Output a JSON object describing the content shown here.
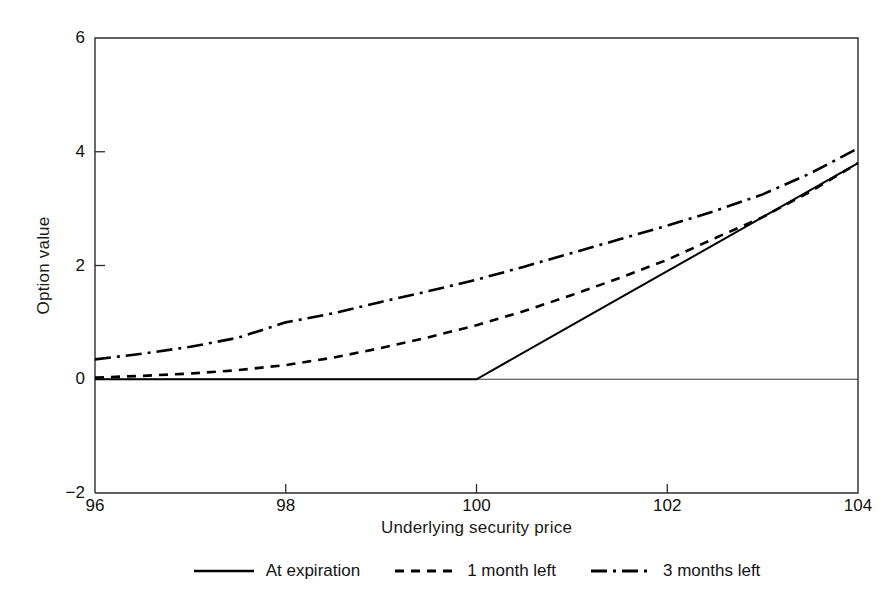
{
  "chart_data": {
    "type": "line",
    "title": "",
    "xlabel": "Underlying security price",
    "ylabel": "Option value",
    "xlim": [
      96,
      104
    ],
    "ylim": [
      -2,
      6
    ],
    "xticks": [
      96,
      98,
      100,
      102,
      104
    ],
    "yticks": [
      -2,
      0,
      2,
      4,
      6
    ],
    "xtick_labels": [
      "96",
      "98",
      "100",
      "102",
      "104"
    ],
    "ytick_labels": [
      "−2",
      "0",
      "2",
      "4",
      "6"
    ],
    "grid": false,
    "legend_position": "below-axis",
    "strike": 100,
    "zero_line": 0,
    "series": [
      {
        "name": "At expiration",
        "style": "solid",
        "x": [
          96,
          97,
          98,
          99,
          100,
          101,
          102,
          103,
          104
        ],
        "values": [
          0,
          0,
          0,
          0,
          0,
          0.95,
          1.9,
          2.85,
          3.8
        ]
      },
      {
        "name": "1 month left",
        "style": "dashed",
        "x": [
          96,
          96.5,
          97,
          97.5,
          98,
          98.5,
          99,
          99.5,
          100,
          100.5,
          101,
          101.5,
          102,
          102.5,
          103,
          103.5,
          104
        ],
        "values": [
          0.03,
          0.06,
          0.1,
          0.16,
          0.25,
          0.38,
          0.55,
          0.74,
          0.95,
          1.2,
          1.48,
          1.78,
          2.1,
          2.48,
          2.85,
          3.3,
          3.8
        ]
      },
      {
        "name": "3 months left",
        "style": "dashdot",
        "x": [
          96,
          96.5,
          97,
          97.5,
          98,
          98.5,
          99,
          99.5,
          100,
          100.5,
          101,
          101.5,
          102,
          102.5,
          103,
          103.5,
          104
        ],
        "values": [
          0.35,
          0.45,
          0.57,
          0.73,
          1.0,
          1.16,
          1.36,
          1.55,
          1.75,
          1.98,
          2.22,
          2.46,
          2.7,
          2.96,
          3.25,
          3.62,
          4.06
        ]
      }
    ]
  },
  "axes": {
    "ylabel": "Option value",
    "xlabel": "Underlying security price"
  },
  "legend": {
    "items": [
      {
        "label": "At expiration",
        "style": "solid"
      },
      {
        "label": "1 month left",
        "style": "dashed"
      },
      {
        "label": "3 months left",
        "style": "dashdot"
      }
    ]
  },
  "colors": {
    "line": "#000000",
    "frame": "#2b2b2b",
    "background": "#ffffff"
  }
}
